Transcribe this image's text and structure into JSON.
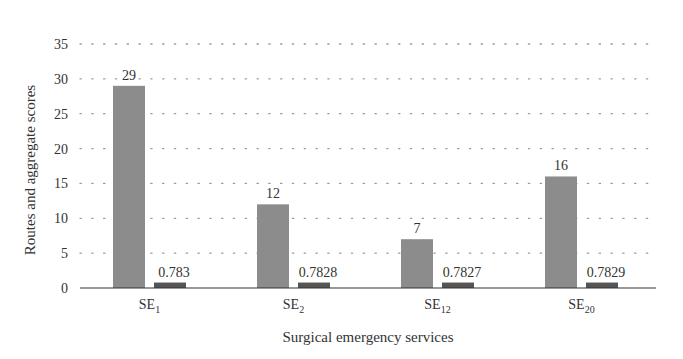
{
  "chart_data": {
    "type": "bar",
    "title": "",
    "xlabel": "Surgical emergency services",
    "ylabel": "Routes and aggregate scores",
    "ylim": [
      0,
      35
    ],
    "yticks": [
      0,
      5,
      10,
      15,
      20,
      25,
      30,
      35
    ],
    "grid": "horizontal dotted",
    "legend": "none",
    "categories": [
      {
        "base": "SE",
        "sub": "1"
      },
      {
        "base": "SE",
        "sub": "2"
      },
      {
        "base": "SE",
        "sub": "12"
      },
      {
        "base": "SE",
        "sub": "20"
      }
    ],
    "series": [
      {
        "name": "Routes",
        "color": "#8c8c8c",
        "values": [
          29,
          12,
          7,
          16
        ],
        "labels": [
          "29",
          "12",
          "7",
          "16"
        ]
      },
      {
        "name": "Aggregate scores",
        "color": "#555555",
        "values": [
          0.783,
          0.7828,
          0.7827,
          0.7829
        ],
        "labels": [
          "0.783",
          "0.7828",
          "0.7827",
          "0.7829"
        ]
      }
    ]
  }
}
